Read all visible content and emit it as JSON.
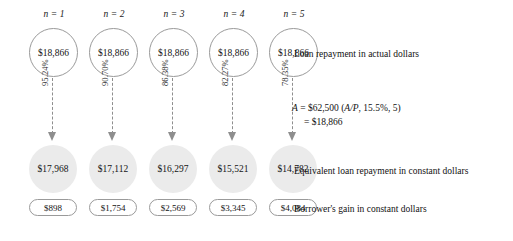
{
  "diagram": {
    "colors": {
      "actual_circle_fill": "#ffffff",
      "actual_circle_stroke": "#9a9a9a",
      "constant_circle_fill": "#ebebeb",
      "gain_pill_stroke": "#9a9a9a",
      "arrow_color": "#8e8e8e",
      "text_color": "#111111",
      "background": "#ffffff"
    },
    "columns": [
      {
        "period_prefix": "n",
        "period_equals": "=",
        "period_number": "1",
        "period_label": "n = 1",
        "actual_payment": "$18,866",
        "deflation_percent": "95.24%",
        "constant_payment": "$17,968",
        "borrower_gain": "$898"
      },
      {
        "period_prefix": "n",
        "period_equals": "=",
        "period_number": "2",
        "period_label": "n = 2",
        "actual_payment": "$18,866",
        "deflation_percent": "90.70%",
        "constant_payment": "$17,112",
        "borrower_gain": "$1,754"
      },
      {
        "period_prefix": "n",
        "period_equals": "=",
        "period_number": "3",
        "period_label": "n = 3",
        "actual_payment": "$18,866",
        "deflation_percent": "86.38%",
        "constant_payment": "$16,297",
        "borrower_gain": "$2,569"
      },
      {
        "period_prefix": "n",
        "period_equals": "=",
        "period_number": "4",
        "period_label": "n = 4",
        "actual_payment": "$18,866",
        "deflation_percent": "82.27%",
        "constant_payment": "$15,521",
        "borrower_gain": "$3,345"
      },
      {
        "period_prefix": "n",
        "period_equals": "=",
        "period_number": "5",
        "period_label": "n = 5",
        "actual_payment": "$18,866",
        "deflation_percent": "78.35%",
        "constant_payment": "$14,782",
        "borrower_gain": "$4,084"
      }
    ],
    "annotations": {
      "actual_row": "Loan repayment in actual dollars",
      "constant_row": "Equivalent loan repayment in constant dollars",
      "gain_row": "Borrower's gain in constant dollars"
    },
    "formula": {
      "symbol": "A",
      "line_1": "A = $62,500 (A/P, 15.5%, 5)",
      "line_2": "= $18,866",
      "principal": "$62,500",
      "factor": "(A/P, 15.5%, 5)",
      "interest_rate": "15.5%",
      "periods": "5",
      "result": "$18,866"
    }
  }
}
